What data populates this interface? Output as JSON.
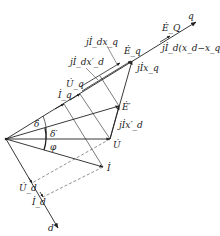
{
  "diagram": {
    "type": "phasor-diagram",
    "title": "",
    "axes": {
      "q_label": "q",
      "d_label": "d"
    },
    "labels": {
      "E_Q": "Ė_Q",
      "jId_xd_xq": "jİ_d(x_d−x_q)",
      "Eq": "Ė_q",
      "jIxq": "jİx_q",
      "jIdxq": "jİ_dx_q",
      "jIdxd_prime": "jİ_dx′_d",
      "Uq": "U̇_q",
      "Iq": "İ_q",
      "E_prime": "Ė′",
      "jIxd_prime": "jİx′_d",
      "delta": "δ",
      "delta_prime": "δ′",
      "phi": "φ",
      "U": "U̇",
      "I": "İ",
      "Ud": "U̇_d",
      "Id": "İ_d"
    },
    "colors": {
      "line": "#222222",
      "dashed": "#444444",
      "background": "#ffffff"
    }
  }
}
